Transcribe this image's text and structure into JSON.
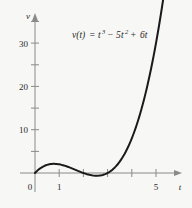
{
  "figure": {
    "name": "cubic-velocity-graph",
    "background_color": "#f7f7f5",
    "curve_color": "#1a1a1a",
    "axis_color": "#8a8a8a"
  },
  "equation": {
    "full": "v(t) = t³ − 5t² + 6t",
    "lhs": "v(t)",
    "equals": "=",
    "term1_base": "t",
    "term1_exp": "3",
    "op1": "−",
    "term2_coef": "5",
    "term2_base": "t",
    "term2_exp": "2",
    "op2": "+",
    "term3": "6t"
  },
  "axes": {
    "y_label": "v",
    "x_label": "t",
    "y_ticks_labeled": [
      "10",
      "20",
      "30"
    ],
    "y_tick_values": [
      10,
      20,
      30
    ],
    "y_minor_ticks": [
      5,
      15,
      25,
      35
    ],
    "x_ticks_labeled": [
      "0",
      "1",
      "5"
    ],
    "x_tick_values": [
      0,
      1,
      5
    ],
    "x_minor_ticks": [
      2,
      3,
      4
    ],
    "origin_label": "0"
  },
  "chart_data": {
    "type": "line",
    "title": "",
    "subtitle": "",
    "xlabel": "t",
    "ylabel": "v",
    "xlim": [
      -0.35,
      6.3
    ],
    "ylim": [
      -4.5,
      38
    ],
    "grid": false,
    "legend": false,
    "annotations": [
      {
        "text": "v(t) = t³ − 5t² + 6t",
        "x": 2.6,
        "y": 34
      }
    ],
    "series": [
      {
        "name": "v(t) = t^3 - 5t^2 + 6t",
        "equation": "t^3 - 5*t^2 + 6*t",
        "color": "#1a1a1a",
        "x": [
          0,
          0.2,
          0.4,
          0.6,
          0.785,
          1.0,
          1.2,
          1.4,
          1.6,
          1.8,
          2.0,
          2.2,
          2.4,
          2.55,
          2.8,
          3.0,
          3.2,
          3.4,
          3.6,
          3.8,
          4.0,
          4.2,
          4.4,
          4.6,
          4.8,
          5.0,
          5.2,
          5.4,
          5.6,
          5.8
        ],
        "y": [
          0,
          1.008,
          1.664,
          2.016,
          2.113,
          2.0,
          1.728,
          1.344,
          0.896,
          0.432,
          0,
          -0.352,
          -0.576,
          -0.631,
          -0.56,
          0,
          0.768,
          1.904,
          3.456,
          5.472,
          8.0,
          11.088,
          14.784,
          19.136,
          24.192,
          30.0,
          36.608,
          44.064,
          52.416,
          61.712
        ],
        "local_max": {
          "t": 0.785,
          "v": 2.11
        },
        "local_min": {
          "t": 2.549,
          "v": -0.63
        },
        "roots": [
          0,
          2,
          3
        ]
      }
    ],
    "x_ticks": [
      0,
      1,
      2,
      3,
      4,
      5
    ],
    "x_ticklabels": [
      "0",
      "1",
      "",
      "",
      "",
      "5"
    ],
    "y_ticks": [
      5,
      10,
      15,
      20,
      25,
      30,
      35
    ],
    "y_ticklabels": [
      "",
      "10",
      "",
      "20",
      "",
      "30",
      ""
    ]
  }
}
